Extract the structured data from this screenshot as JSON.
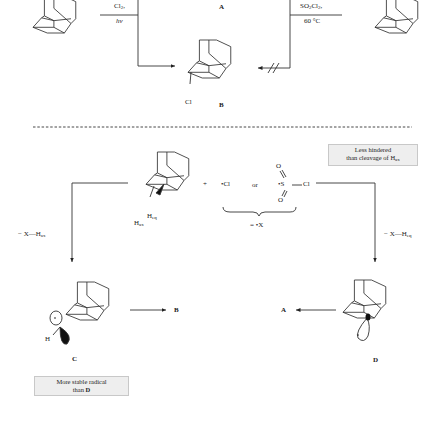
{
  "top_scheme": {
    "left_reagent": {
      "line1": "Cl",
      "line1_sub": "2",
      "line1_suffix": ",",
      "line2": "hν"
    },
    "right_reagent": {
      "line1_a": "SO",
      "line1_sub1": "2",
      "line1_b": "Cl",
      "line1_sub2": "2",
      "line1_suffix": ",",
      "line2": "60 °C"
    },
    "product_a_label": "A",
    "product_b_label": "B",
    "product_b_substituent": "Cl",
    "blocked_arrow_mark": "//"
  },
  "mechanism": {
    "plus": "+",
    "radical_cl": "•Cl",
    "or": "or",
    "sulfonyl_radical": {
      "o_top": "O",
      "o_bottom": "O",
      "s": "•S",
      "cl": "Cl"
    },
    "equals_x": "= •X",
    "h_eq": "H",
    "h_eq_sub": "eq",
    "h_ax": "H",
    "h_ax_sub": "ax",
    "left_loss": {
      "prefix": "− X—H",
      "sub": "ax"
    },
    "right_loss": {
      "prefix": "− X—H",
      "sub": "eq"
    },
    "note_less_hindered": {
      "line1": "Less hindered",
      "line2": "than cleavage of H",
      "line2_sub": "ax"
    }
  },
  "radicals": {
    "c_label": "C",
    "d_label": "D",
    "c_h": "H",
    "c_to": "B",
    "d_to": "A",
    "note_more_stable": {
      "line1": "More stable radical",
      "line2_prefix": "than ",
      "line2_bold": "D"
    }
  },
  "colors": {
    "line": "#333333",
    "box_bg": "#eeeeee",
    "box_border": "#c8c8c8"
  }
}
